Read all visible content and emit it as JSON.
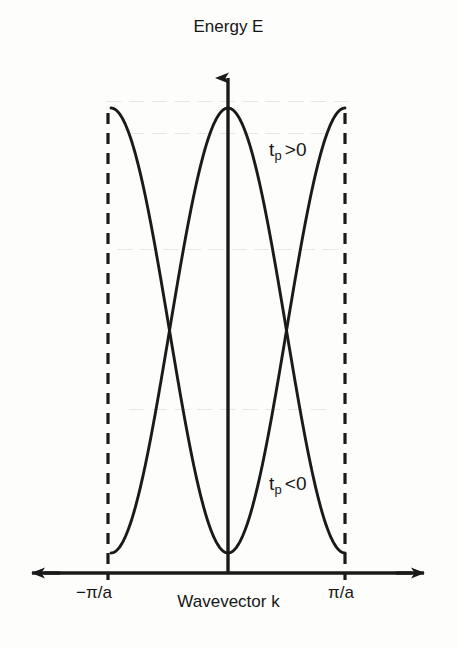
{
  "figure": {
    "kind": "band-structure-diagram",
    "axis_title_y": "Energy E",
    "axis_title_x": "Wavevector k",
    "tick_left": "−π/a",
    "tick_right": "π/a",
    "stroke_color": "#1a1a1a",
    "background_color": "#fdfdfc",
    "annotations": [
      {
        "symbol": "t",
        "subscript": "p",
        "relation": ">0",
        "full": "t_p >0"
      },
      {
        "symbol": "t",
        "subscript": "p",
        "relation": "<0",
        "full": "t_p <0"
      }
    ],
    "bleed_text": [
      "— — — — — — — — — — —",
      "— —  — — — — — —  —",
      "— — — — —  — — — — —",
      "— — — —  — — — — —"
    ]
  },
  "chart_data": {
    "type": "line",
    "title": "",
    "xlabel": "Wavevector k",
    "ylabel": "Energy E",
    "xlim": [
      -1,
      1
    ],
    "ylim": [
      -1,
      1
    ],
    "xtick_values": [
      -1,
      0,
      1
    ],
    "xtick_labels": [
      "−π/a",
      "",
      "π/a"
    ],
    "ytick_values": [],
    "ytick_labels": [],
    "grid": false,
    "legend": "none",
    "axis_arrows": {
      "x": "both",
      "y": "up"
    },
    "brillouin_zone_boundaries": [
      -1,
      1
    ],
    "boundary_line_style": "dashed",
    "series": [
      {
        "name": "t_p >0",
        "formula": "E = +cos(pi*k)",
        "annotation": "t_p >0",
        "annotation_at": [
          0.35,
          0.62
        ],
        "x": [
          -1.0,
          -0.9,
          -0.8,
          -0.7,
          -0.6,
          -0.5,
          -0.4,
          -0.3,
          -0.2,
          -0.1,
          0.0,
          0.1,
          0.2,
          0.3,
          0.4,
          0.5,
          0.6,
          0.7,
          0.8,
          0.9,
          1.0
        ],
        "y": [
          -1.0,
          -0.951,
          -0.809,
          -0.588,
          -0.309,
          0.0,
          0.309,
          0.588,
          0.809,
          0.951,
          1.0,
          0.951,
          0.809,
          0.588,
          0.309,
          0.0,
          -0.309,
          -0.588,
          -0.809,
          -0.951,
          -1.0
        ]
      },
      {
        "name": "t_p <0",
        "formula": "E = -cos(pi*k)",
        "annotation": "t_p <0",
        "annotation_at": [
          0.35,
          -0.62
        ],
        "x": [
          -1.0,
          -0.9,
          -0.8,
          -0.7,
          -0.6,
          -0.5,
          -0.4,
          -0.3,
          -0.2,
          -0.1,
          0.0,
          0.1,
          0.2,
          0.3,
          0.4,
          0.5,
          0.6,
          0.7,
          0.8,
          0.9,
          1.0
        ],
        "y": [
          1.0,
          0.951,
          0.809,
          0.588,
          0.309,
          0.0,
          -0.309,
          -0.588,
          -0.809,
          -0.951,
          -1.0,
          -0.951,
          -0.809,
          -0.588,
          -0.309,
          0.0,
          0.309,
          0.588,
          0.809,
          0.951,
          1.0
        ]
      }
    ]
  }
}
